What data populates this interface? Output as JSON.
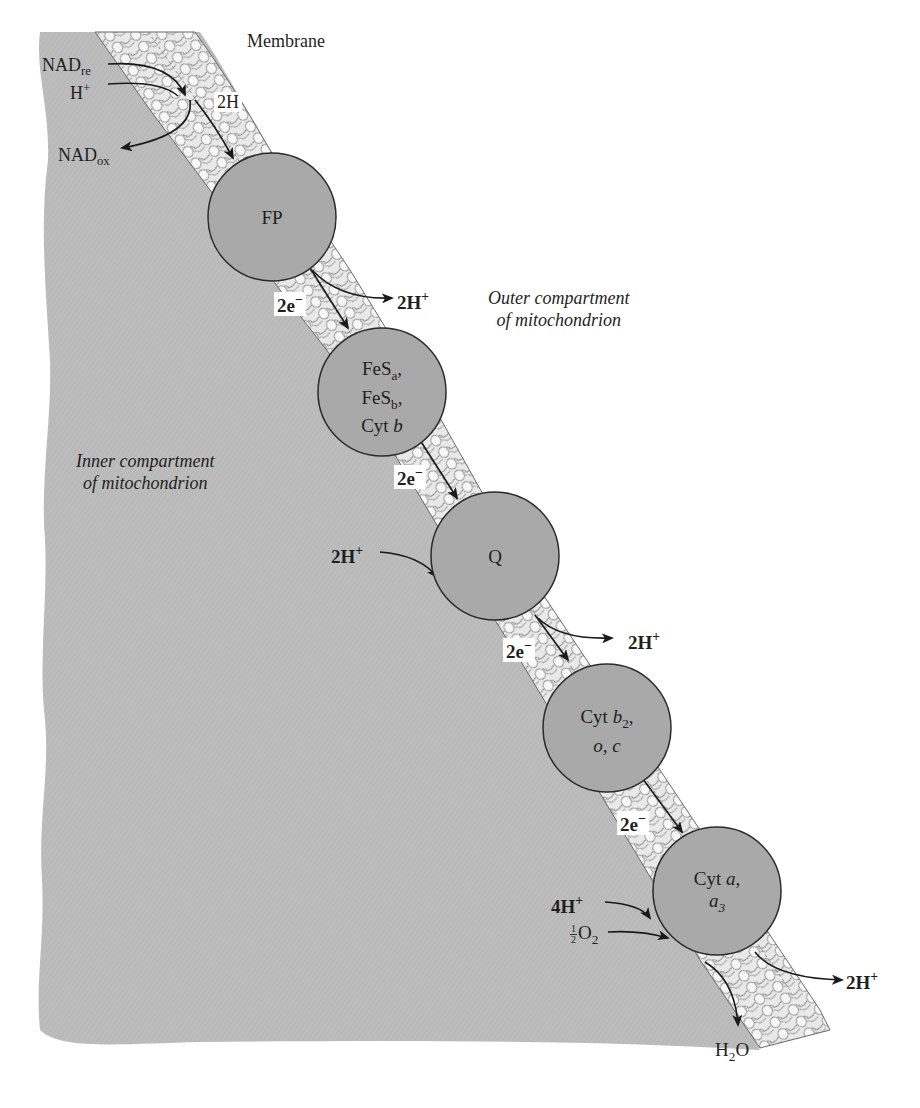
{
  "diagram": {
    "title_label": "Membrane",
    "colors": {
      "inner_compartment": "#b9b9b9",
      "complex_fill": "#a9a9a9",
      "complex_stroke": "#2a2a2a",
      "membrane_lipid": "#efefef",
      "arrow": "#1a1a1a",
      "background": "#ffffff"
    },
    "regions": {
      "outer": {
        "line1": "Outer compartment",
        "line2": "of mitochondrion"
      },
      "inner": {
        "line1": "Inner compartment",
        "line2": "of mitochondrion"
      }
    },
    "entry": {
      "nad_red": "NAD",
      "nad_red_sub": "re",
      "h_plus": "H",
      "h_plus_sup": "+",
      "nad_ox": "NAD",
      "nad_ox_sub": "ox",
      "two_h": "2H"
    },
    "complexes": [
      {
        "id": "fp",
        "lines": [
          "FP"
        ]
      },
      {
        "id": "fes",
        "lines": [
          "FeS",
          "FeS",
          "Cyt "
        ],
        "subs": [
          "a",
          "b"
        ],
        "italic": "b"
      },
      {
        "id": "q",
        "lines": [
          "Q"
        ]
      },
      {
        "id": "cyt-b2",
        "line1": "Cyt ",
        "line1_italic": "b",
        "line1_sub": "2",
        "line2": "o, c"
      },
      {
        "id": "cyt-a",
        "line1": "Cyt ",
        "line1_italic": "a,",
        "line2": "a",
        "line2_sub": "3"
      }
    ],
    "electron_labels": [
      "2e",
      "2e",
      "2e",
      "2e"
    ],
    "electron_sup": "−",
    "proton_out": [
      {
        "text": "2H",
        "sup": "+"
      },
      {
        "text": "2H",
        "sup": "+"
      },
      {
        "text": "2H",
        "sup": "+"
      }
    ],
    "proton_in": [
      {
        "text": "2H",
        "sup": "+"
      },
      {
        "text": "4H",
        "sup": "+"
      }
    ],
    "oxygen": {
      "num": "1",
      "den": "2",
      "text": "O",
      "sub": "2"
    },
    "water": {
      "text": "H",
      "sub": "2",
      "tail": "O"
    }
  }
}
